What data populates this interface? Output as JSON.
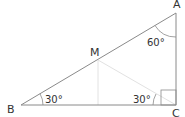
{
  "diagram": {
    "type": "right-triangle",
    "vertices": [
      {
        "id": "A",
        "label": "A",
        "x": 176,
        "y": 13
      },
      {
        "id": "B",
        "label": "B",
        "x": 21,
        "y": 105
      },
      {
        "id": "C",
        "label": "C",
        "x": 176,
        "y": 105
      },
      {
        "id": "M",
        "label": "M",
        "x": 98,
        "y": 60
      }
    ],
    "angles": {
      "A": "60°",
      "B": "30°",
      "C_inner": "30°"
    },
    "right_angle_at": "C",
    "colors": {
      "line": "#8a8a8a",
      "faint_line": "#dddddd",
      "text": "#333333"
    }
  }
}
